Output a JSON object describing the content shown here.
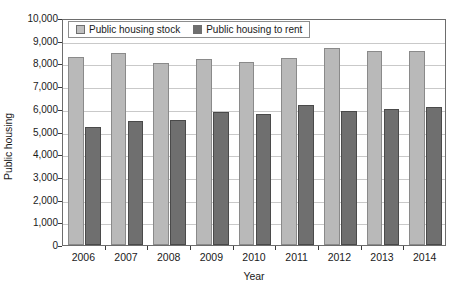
{
  "chart_data": {
    "type": "bar",
    "title": "",
    "xlabel": "Year",
    "ylabel": "Public housing",
    "categories": [
      "2006",
      "2007",
      "2008",
      "2009",
      "2010",
      "2011",
      "2012",
      "2013",
      "2014"
    ],
    "series": [
      {
        "name": "Public housing stock",
        "color": "#b9b9b9",
        "values": [
          8300,
          8450,
          8000,
          8180,
          8080,
          8220,
          8670,
          8550,
          8550
        ]
      },
      {
        "name": "Public housing to rent",
        "color": "#6f6f6f",
        "values": [
          5200,
          5480,
          5500,
          5850,
          5750,
          6170,
          5900,
          6000,
          6080
        ]
      }
    ],
    "ylim": [
      0,
      10000
    ],
    "yticks": [
      "0",
      "1,000",
      "2,000",
      "3,000",
      "4,000",
      "5,000",
      "6,000",
      "7,000",
      "8,000",
      "9,000",
      "10,000"
    ],
    "ytick_values": [
      0,
      1000,
      2000,
      3000,
      4000,
      5000,
      6000,
      7000,
      8000,
      9000,
      10000
    ],
    "grid": true,
    "legend_position": "top-left"
  },
  "legend": {
    "entries": [
      {
        "label": "Public housing stock"
      },
      {
        "label": "Public housing to rent"
      }
    ]
  }
}
